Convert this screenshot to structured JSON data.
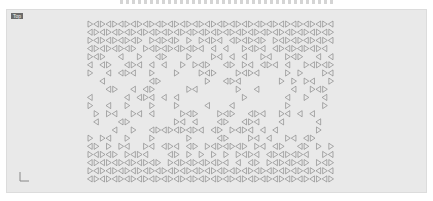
{
  "viewport": {
    "label": "Top",
    "background": "#e9e9e9",
    "pattern": {
      "type": "triangular-lattice",
      "cols": 40,
      "rows": 20,
      "stroke": "#7a7a7a"
    }
  }
}
